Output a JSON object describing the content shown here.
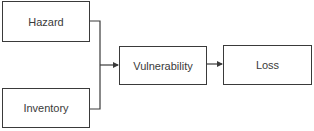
{
  "diagram": {
    "type": "flowchart",
    "nodes": [
      {
        "id": "hazard",
        "label": "Hazard"
      },
      {
        "id": "inventory",
        "label": "Inventory"
      },
      {
        "id": "vulnerability",
        "label": "Vulnerability"
      },
      {
        "id": "loss",
        "label": "Loss"
      }
    ],
    "edges": [
      {
        "from": "hazard",
        "to": "vulnerability"
      },
      {
        "from": "inventory",
        "to": "vulnerability"
      },
      {
        "from": "vulnerability",
        "to": "loss"
      }
    ],
    "colors": {
      "stroke": "#3a3a3a",
      "background": "#ffffff",
      "text": "#3a3a3a"
    }
  }
}
